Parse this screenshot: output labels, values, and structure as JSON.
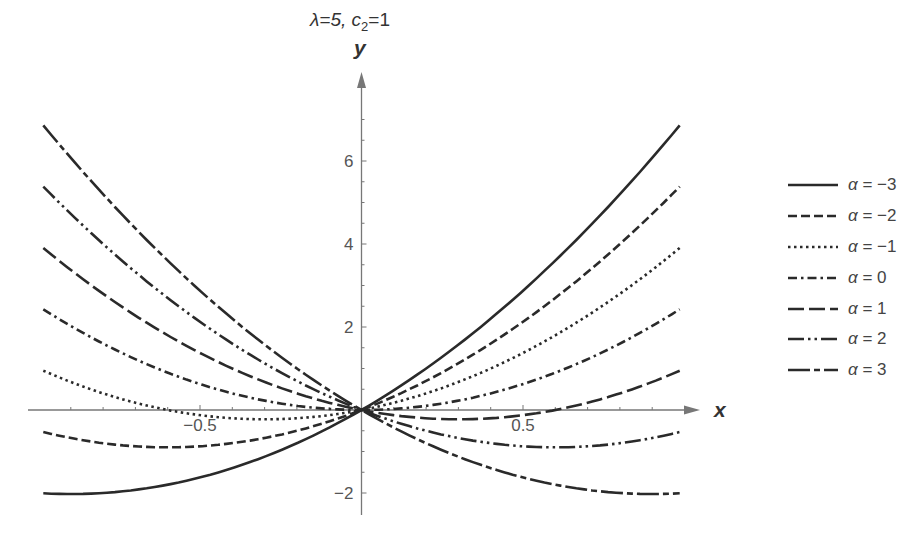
{
  "title": {
    "lambda_label": "λ=5,",
    "c_label": "c",
    "c_sub": "2",
    "c_value": "=1"
  },
  "axes": {
    "xlabel": "x",
    "ylabel": "y"
  },
  "chart_data": {
    "type": "line",
    "title": "λ=5, c2=1",
    "xlabel": "x",
    "ylabel": "y",
    "xlim": [
      -1,
      1
    ],
    "ylim": [
      -2.3,
      7.3
    ],
    "x_ticks": [
      -0.5,
      0.5
    ],
    "x_tick_labels": [
      "-0.5",
      "0.5"
    ],
    "y_ticks": [
      -2,
      2,
      4,
      6
    ],
    "y_tick_labels": [
      "-2",
      "2",
      "4",
      "6"
    ],
    "grid": false,
    "legend_position": "right",
    "x": [
      -1,
      -0.75,
      -0.5,
      -0.25,
      0,
      0.25,
      0.5,
      0.75,
      1
    ],
    "series": [
      {
        "name": "α = −3",
        "alpha": "−3",
        "style": "solid",
        "values": [
          -2,
          -1.97,
          -1.625,
          -0.97,
          0,
          1.28,
          2.875,
          4.78,
          7
        ]
      },
      {
        "name": "α = −2",
        "alpha": "−2",
        "style": "dashed",
        "values": [
          -0.5,
          -0.84,
          -0.875,
          -0.59,
          0,
          0.91,
          2.125,
          3.66,
          5.5
        ]
      },
      {
        "name": "α = −1",
        "alpha": "−1",
        "style": "dotted",
        "values": [
          1,
          0.28,
          -0.125,
          -0.22,
          0,
          0.53,
          1.375,
          2.53,
          4
        ]
      },
      {
        "name": "α = 0",
        "alpha": "0",
        "style": "dash-dot",
        "values": [
          2.5,
          1.41,
          0.625,
          0.16,
          0,
          0.16,
          0.625,
          1.41,
          2.5
        ]
      },
      {
        "name": "α = 1",
        "alpha": "1",
        "style": "long-dash",
        "values": [
          4,
          2.53,
          1.375,
          0.53,
          0,
          -0.22,
          -0.125,
          0.28,
          1
        ]
      },
      {
        "name": "α = 2",
        "alpha": "2",
        "style": "dash-dot-dot",
        "values": [
          5.5,
          3.66,
          2.125,
          0.91,
          0,
          -0.59,
          -0.875,
          -0.84,
          -0.5
        ]
      },
      {
        "name": "α = 3",
        "alpha": "3",
        "style": "long-short-dash",
        "values": [
          7,
          4.78,
          2.875,
          1.28,
          0,
          -0.97,
          -1.625,
          -1.97,
          -2
        ]
      }
    ]
  },
  "legend": [
    {
      "prefix": "α",
      "eq": " = ",
      "value": "−3"
    },
    {
      "prefix": "α",
      "eq": " = ",
      "value": "−2"
    },
    {
      "prefix": "α",
      "eq": " = ",
      "value": "−1"
    },
    {
      "prefix": "α",
      "eq": " = ",
      "value": "0"
    },
    {
      "prefix": "α",
      "eq": " = ",
      "value": "1"
    },
    {
      "prefix": "α",
      "eq": " = ",
      "value": "2"
    },
    {
      "prefix": "α",
      "eq": " = ",
      "value": "3"
    }
  ]
}
